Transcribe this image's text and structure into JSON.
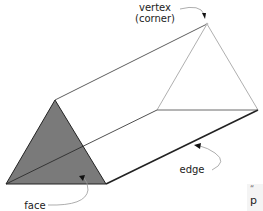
{
  "diagram": {
    "labels": {
      "vertex_line1": "vertex",
      "vertex_line2": "(corner)",
      "edge": "edge",
      "face": "face"
    },
    "colors": {
      "face_fill": "#7a7a7a",
      "edge_stroke": "#222222",
      "back_edge": "#9a9a9a",
      "pointer": "#999999"
    },
    "clipped_text": {
      "quote": "“",
      "letter": "p"
    }
  }
}
